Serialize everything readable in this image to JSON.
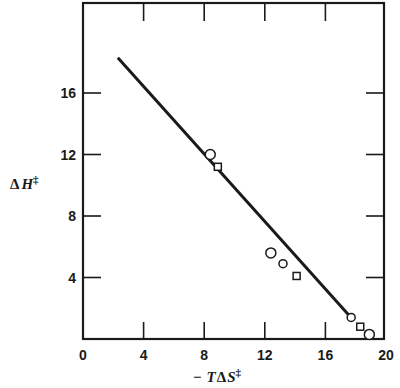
{
  "chart_data": {
    "type": "scatter",
    "title": "",
    "xlabel": "− TΔS‡",
    "ylabel": "ΔH‡",
    "xlim": [
      0,
      20
    ],
    "ylim": [
      0,
      21.8
    ],
    "x_ticks": [
      0,
      4,
      8,
      12,
      16,
      20
    ],
    "y_ticks": [
      4,
      8,
      12,
      16
    ],
    "x_tick_labels": [
      "0",
      "4",
      "8",
      "12",
      "16",
      "20"
    ],
    "y_tick_labels": [
      "4",
      "8",
      "12",
      "16"
    ],
    "grid": false,
    "legend": null,
    "series": [
      {
        "name": "circles",
        "marker": "circle",
        "points": [
          {
            "x": 8.4,
            "y": 12.0,
            "size": "large"
          },
          {
            "x": 12.4,
            "y": 5.6,
            "size": "large"
          },
          {
            "x": 13.2,
            "y": 4.9,
            "size": "small"
          },
          {
            "x": 17.7,
            "y": 1.4,
            "size": "small"
          },
          {
            "x": 18.9,
            "y": 0.3,
            "size": "large"
          }
        ]
      },
      {
        "name": "squares",
        "marker": "square",
        "points": [
          {
            "x": 8.9,
            "y": 11.2
          },
          {
            "x": 14.1,
            "y": 4.1
          },
          {
            "x": 18.3,
            "y": 0.8
          }
        ]
      },
      {
        "name": "fit-line",
        "type": "line",
        "points": [
          {
            "x": 2.3,
            "y": 18.3
          },
          {
            "x": 17.6,
            "y": 1.5
          }
        ]
      }
    ]
  },
  "labels": {
    "ylabel_delta": "Δ",
    "ylabel_var": "H",
    "ylabel_sup": "‡",
    "xlabel_minus": "−",
    "xlabel_T": "T",
    "xlabel_delta": "Δ",
    "xlabel_S": "S",
    "xlabel_sup": "‡"
  }
}
